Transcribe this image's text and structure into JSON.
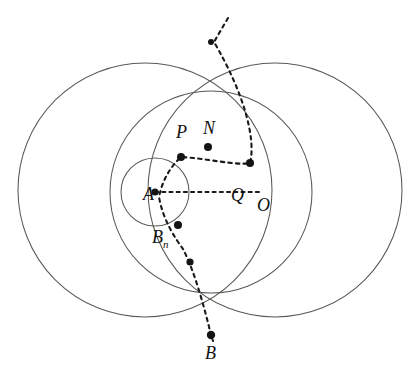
{
  "figure": {
    "background_color": "#ffffff",
    "curve_color": "#5a5a55",
    "dash_color": "#1a1a1a",
    "point_color": "#141414",
    "canvas": {
      "width": 418,
      "height": 374
    }
  },
  "labels": [
    {
      "name": "label-P",
      "text": "P",
      "x": 176,
      "y": 123,
      "sub": ""
    },
    {
      "name": "label-N",
      "text": "N",
      "x": 203,
      "y": 119,
      "sub": ""
    },
    {
      "name": "label-A",
      "text": "A",
      "x": 143,
      "y": 185,
      "sub": ""
    },
    {
      "name": "label-Q",
      "text": "Q",
      "x": 231,
      "y": 186,
      "sub": ""
    },
    {
      "name": "label-O",
      "text": "O",
      "x": 257,
      "y": 196,
      "sub": ""
    },
    {
      "name": "label-Bn",
      "text": "B",
      "x": 152,
      "y": 228,
      "sub": "n"
    },
    {
      "name": "label-B",
      "text": "B",
      "x": 205,
      "y": 344,
      "sub": ""
    }
  ],
  "shapes": {
    "large_circle_left": {
      "cx": 145,
      "cy": 190,
      "r": 127
    },
    "large_circle_right": {
      "cx": 275,
      "cy": 190,
      "r": 127
    },
    "medium_circle": {
      "cx": 211,
      "cy": 192,
      "r": 101
    },
    "small_circle": {
      "cx": 155,
      "cy": 192,
      "r": 34
    }
  },
  "dashed_paths": {
    "radius_AO": {
      "from": [
        155,
        192
      ],
      "to": [
        259,
        192
      ]
    },
    "spiral": "M 228 18 L 214 42 C 245 95 256 140 250 163 C 238 166 204 158 181 157 C 169 168 162 182 159 197 C 163 220 175 238 183 249 C 195 272 205 310 211 335 L 213 341"
  },
  "points": [
    {
      "name": "point-top-intersection",
      "x": 211,
      "y": 42,
      "r": 3.0
    },
    {
      "name": "point-Q",
      "x": 250,
      "y": 163,
      "r": 4.0
    },
    {
      "name": "point-N",
      "x": 208,
      "y": 147,
      "r": 4.0
    },
    {
      "name": "point-P",
      "x": 181,
      "y": 157,
      "r": 4.0
    },
    {
      "name": "point-A",
      "x": 155,
      "y": 192,
      "r": 3.6
    },
    {
      "name": "point-Bn",
      "x": 178,
      "y": 225,
      "r": 4.0
    },
    {
      "name": "point-intermediate",
      "x": 190,
      "y": 262,
      "r": 3.6
    },
    {
      "name": "point-B",
      "x": 211,
      "y": 335,
      "r": 4.2
    }
  ]
}
